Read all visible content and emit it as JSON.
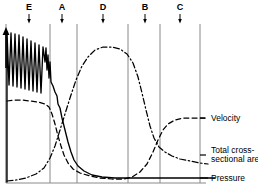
{
  "figure": {
    "title": "",
    "background_color": "#ffffff",
    "ink_color": "#000000",
    "gridline_color": "#888888",
    "width": 258,
    "height": 188
  },
  "axes": {
    "y_axis_arrow": "up-arrow",
    "y_axis_label": "",
    "x_axis_label": "",
    "x_axis_line_y": 183,
    "y_axis_line_x": 6
  },
  "region_markers": [
    {
      "label": "E",
      "x": 29,
      "arrow": "down-arrow"
    },
    {
      "label": "A",
      "x": 62,
      "arrow": "down-arrow"
    },
    {
      "label": "D",
      "x": 103,
      "arrow": "down-arrow"
    },
    {
      "label": "B",
      "x": 145,
      "arrow": "down-arrow"
    },
    {
      "label": "C",
      "x": 180,
      "arrow": "down-arrow"
    }
  ],
  "gridlines_x": [
    6,
    50,
    77,
    128,
    160,
    200
  ],
  "legend": [
    {
      "name": "velocity",
      "label": "Velocity",
      "style": "dashed",
      "y": 118
    },
    {
      "name": "total-cross-sectional-area",
      "label": "Total cross-\nsectional area",
      "style": "dash-dot",
      "y": 155
    },
    {
      "name": "pressure",
      "label": "Pressure",
      "style": "solid",
      "y": 178
    }
  ],
  "chart_data": {
    "type": "line",
    "title": "",
    "xlabel": "",
    "ylabel": "",
    "xlim": [
      0,
      200
    ],
    "ylim": [
      0,
      1
    ],
    "grid": "vertical-only",
    "legend_position": "right",
    "annotations": [
      {
        "text": "E",
        "x_px": 29
      },
      {
        "text": "A",
        "x_px": 62
      },
      {
        "text": "D",
        "x_px": 103
      },
      {
        "text": "B",
        "x_px": 145
      },
      {
        "text": "C",
        "x_px": 180
      }
    ],
    "series": [
      {
        "name": "Pressure",
        "style": "solid",
        "description": "Oscillating high pressure with damped sawtooth pulses in the aorta/arteries, falling steeply at the arterioles, then flat and low through capillaries, veins and vena cava.",
        "points_px": [
          [
            7,
            182
          ],
          [
            7,
            32
          ],
          [
            9,
            85
          ],
          [
            11,
            33
          ],
          [
            13,
            86
          ],
          [
            15,
            34
          ],
          [
            17,
            87
          ],
          [
            19,
            35
          ],
          [
            21,
            88
          ],
          [
            23,
            37
          ],
          [
            25,
            89
          ],
          [
            27,
            39
          ],
          [
            29,
            90
          ],
          [
            31,
            41
          ],
          [
            33,
            91
          ],
          [
            35,
            43
          ],
          [
            37,
            92
          ],
          [
            39,
            45
          ],
          [
            41,
            93
          ],
          [
            43,
            47
          ],
          [
            45,
            62
          ],
          [
            46,
            48
          ],
          [
            47,
            70
          ],
          [
            48,
            55
          ],
          [
            49,
            78
          ],
          [
            50,
            62
          ],
          [
            51,
            82
          ],
          [
            53,
            86
          ],
          [
            55,
            92
          ],
          [
            57,
            96
          ],
          [
            58,
            104
          ],
          [
            60,
            108
          ],
          [
            62,
            118
          ],
          [
            64,
            126
          ],
          [
            66,
            134
          ],
          [
            68,
            142
          ],
          [
            71,
            152
          ],
          [
            74,
            160
          ],
          [
            78,
            166
          ],
          [
            84,
            171
          ],
          [
            92,
            175
          ],
          [
            102,
            177
          ],
          [
            115,
            178
          ],
          [
            130,
            178
          ],
          [
            150,
            178
          ],
          [
            175,
            178
          ],
          [
            200,
            178
          ],
          [
            215,
            178
          ]
        ]
      },
      {
        "name": "Velocity",
        "style": "dashed",
        "description": "High in aorta, gently declining, falls sharply at arterioles to a capillary minimum, then rises through venules and veins to a moderate plateau in the vena cava.",
        "points_px": [
          [
            7,
            101
          ],
          [
            14,
            100
          ],
          [
            22,
            100
          ],
          [
            30,
            101
          ],
          [
            38,
            102
          ],
          [
            45,
            104
          ],
          [
            49,
            107
          ],
          [
            52,
            114
          ],
          [
            55,
            124
          ],
          [
            58,
            136
          ],
          [
            61,
            146
          ],
          [
            64,
            155
          ],
          [
            68,
            163
          ],
          [
            73,
            169
          ],
          [
            80,
            173
          ],
          [
            90,
            176
          ],
          [
            100,
            178
          ],
          [
            112,
            179
          ],
          [
            124,
            179
          ],
          [
            132,
            177
          ],
          [
            140,
            172
          ],
          [
            147,
            164
          ],
          [
            153,
            152
          ],
          [
            158,
            140
          ],
          [
            163,
            130
          ],
          [
            168,
            124
          ],
          [
            175,
            120
          ],
          [
            183,
            118
          ],
          [
            192,
            118
          ],
          [
            200,
            118
          ],
          [
            206,
            118
          ]
        ]
      },
      {
        "name": "Total cross-sectional area",
        "style": "dash-dot",
        "description": "Very small in the aorta and arteries, rising steeply through the arterioles to a broad maximum in the capillaries, then falling through venules and veins to a small value in the vena cava.",
        "points_px": [
          [
            7,
            181
          ],
          [
            16,
            180
          ],
          [
            26,
            178
          ],
          [
            36,
            174
          ],
          [
            44,
            168
          ],
          [
            50,
            158
          ],
          [
            55,
            146
          ],
          [
            60,
            130
          ],
          [
            65,
            114
          ],
          [
            70,
            98
          ],
          [
            76,
            80
          ],
          [
            82,
            66
          ],
          [
            88,
            57
          ],
          [
            95,
            50
          ],
          [
            103,
            47
          ],
          [
            112,
            47
          ],
          [
            120,
            49
          ],
          [
            127,
            54
          ],
          [
            133,
            63
          ],
          [
            138,
            77
          ],
          [
            142,
            93
          ],
          [
            146,
            110
          ],
          [
            150,
            126
          ],
          [
            154,
            138
          ],
          [
            159,
            147
          ],
          [
            165,
            152
          ],
          [
            172,
            156
          ],
          [
            180,
            159
          ],
          [
            190,
            161
          ],
          [
            200,
            163
          ],
          [
            208,
            164
          ]
        ]
      }
    ]
  }
}
